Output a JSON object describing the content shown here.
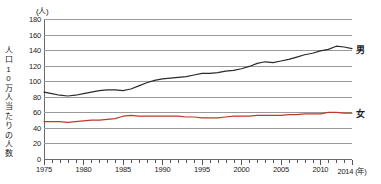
{
  "chart_data": {
    "type": "line",
    "title": "",
    "unit_label": "(人)",
    "ylabel": "人口10万人当たりの人数",
    "ylabel_chars": [
      "人",
      "口",
      "1",
      "0",
      "万",
      "人",
      "当",
      "た",
      "り",
      "の",
      "人",
      "数"
    ],
    "xlabel": "(年)",
    "xlim": [
      1975,
      2014
    ],
    "ylim": [
      0,
      180
    ],
    "ytick_step": 20,
    "grid": true,
    "legend_position": "right-inline",
    "x": [
      1975,
      1976,
      1977,
      1978,
      1979,
      1980,
      1981,
      1982,
      1983,
      1984,
      1985,
      1986,
      1987,
      1988,
      1989,
      1990,
      1991,
      1992,
      1993,
      1994,
      1995,
      1996,
      1997,
      1998,
      1999,
      2000,
      2001,
      2002,
      2003,
      2004,
      2005,
      2006,
      2007,
      2008,
      2009,
      2010,
      2011,
      2012,
      2013,
      2014
    ],
    "yticks": [
      0,
      20,
      40,
      60,
      80,
      100,
      120,
      140,
      160,
      180
    ],
    "xtick_labels": [
      {
        "value": 1975,
        "label": "1975"
      },
      {
        "value": 1980,
        "label": "1980"
      },
      {
        "value": 1985,
        "label": "1985"
      },
      {
        "value": 1990,
        "label": "1990"
      },
      {
        "value": 1995,
        "label": "1995"
      },
      {
        "value": 2000,
        "label": "2000"
      },
      {
        "value": 2005,
        "label": "2005"
      },
      {
        "value": 2010,
        "label": "2010"
      },
      {
        "value": 2014,
        "label": "2014 (年)"
      }
    ],
    "series": [
      {
        "name": "男",
        "color": "#2b2b2b",
        "end_label": "男",
        "values": [
          86,
          84,
          82,
          81,
          82,
          84,
          86,
          88,
          89,
          89,
          88,
          90,
          94,
          98,
          101,
          103,
          104,
          105,
          106,
          108,
          110,
          110,
          111,
          113,
          114,
          116,
          119,
          123,
          125,
          124,
          126,
          128,
          131,
          134,
          136,
          139,
          141,
          145,
          144,
          142
        ]
      },
      {
        "name": "女",
        "color": "#c0392b",
        "end_label": "女",
        "values": [
          48,
          48,
          48,
          47,
          48,
          49,
          50,
          50,
          51,
          52,
          55,
          56,
          55,
          55,
          55,
          55,
          55,
          55,
          54,
          54,
          53,
          53,
          53,
          54,
          55,
          55,
          55,
          56,
          56,
          56,
          56,
          57,
          57,
          58,
          58,
          58,
          60,
          60,
          59,
          59
        ]
      }
    ]
  }
}
